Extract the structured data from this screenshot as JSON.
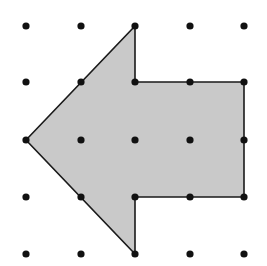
{
  "diagram": {
    "type": "dot-grid-shape",
    "grid": {
      "columns": 5,
      "rows": 5,
      "x_positions": [
        26,
        81,
        135,
        190,
        244
      ],
      "y_positions": [
        26,
        82,
        140,
        197,
        254
      ],
      "dot_radius": 3.6,
      "dot_color": "#111111"
    },
    "shape": {
      "name": "arrow-left",
      "fill": "#c9c9c9",
      "stroke": "#1a1a1a",
      "stroke_width": 1.6,
      "vertices_grid": [
        [
          0,
          2
        ],
        [
          2,
          0
        ],
        [
          2,
          1
        ],
        [
          4,
          1
        ],
        [
          4,
          3
        ],
        [
          2,
          3
        ],
        [
          2,
          4
        ]
      ],
      "vertices_px": [
        [
          26,
          140
        ],
        [
          135,
          26
        ],
        [
          135,
          82
        ],
        [
          244,
          82
        ],
        [
          244,
          197
        ],
        [
          135,
          197
        ],
        [
          135,
          254
        ]
      ]
    },
    "colors": {
      "background": "#ffffff",
      "fill": "#c9c9c9",
      "outline": "#1a1a1a",
      "dots": "#111111"
    }
  }
}
